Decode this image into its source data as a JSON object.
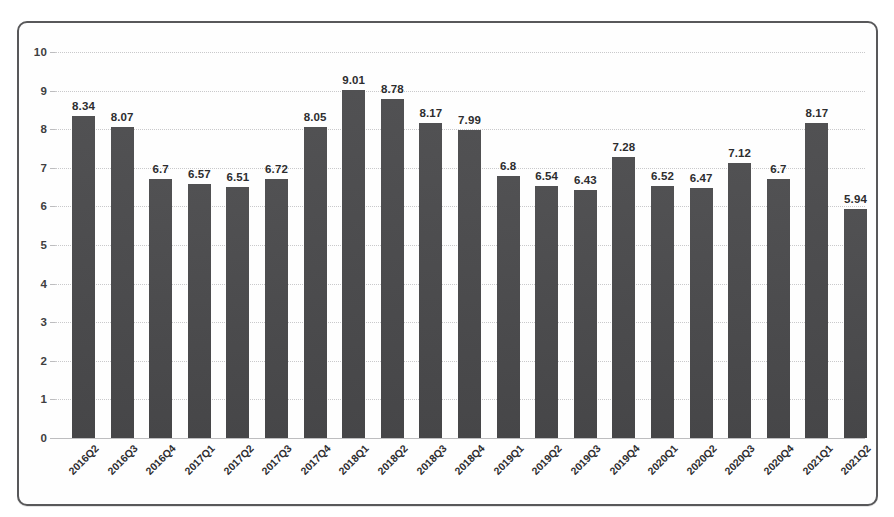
{
  "chart_data": {
    "type": "bar",
    "title": "",
    "subtitle": "",
    "xlabel": "",
    "ylabel": "",
    "ylim": [
      0,
      10
    ],
    "ytick_values": [
      0,
      1,
      2,
      3,
      4,
      5,
      6,
      7,
      8,
      9,
      10
    ],
    "ytick_labels": [
      "0",
      "1",
      "2",
      "3",
      "4",
      "5",
      "6",
      "7",
      "8",
      "9",
      "10"
    ],
    "grid": true,
    "grid_axis": "y",
    "legend": false,
    "legend_position": "none",
    "data_labels": true,
    "bar_color": "#4b4b4d",
    "categories": [
      "2016Q2",
      "2016Q3",
      "2016Q4",
      "2017Q1",
      "2017Q2",
      "2017Q3",
      "2017Q4",
      "2018Q1",
      "2018Q2",
      "2018Q3",
      "2018Q4",
      "2019Q1",
      "2019Q2",
      "2019Q3",
      "2019Q4",
      "2020Q1",
      "2020Q2",
      "2020Q3",
      "2020Q4",
      "2021Q1",
      "2021Q2"
    ],
    "values": [
      8.34,
      8.07,
      6.7,
      6.57,
      6.51,
      6.72,
      8.05,
      9.01,
      8.78,
      8.17,
      7.99,
      6.8,
      6.54,
      6.43,
      7.28,
      6.52,
      6.47,
      7.12,
      6.7,
      8.17,
      5.94
    ],
    "value_labels": [
      "8.34",
      "8.07",
      "6.7",
      "6.57",
      "6.51",
      "6.72",
      "8.05",
      "9.01",
      "8.78",
      "8.17",
      "7.99",
      "6.8",
      "6.54",
      "6.43",
      "7.28",
      "6.52",
      "6.47",
      "7.12",
      "6.7",
      "8.17",
      "5.94"
    ]
  },
  "frame": {
    "border_color": "#58585a",
    "background_color": "#fefefe"
  }
}
